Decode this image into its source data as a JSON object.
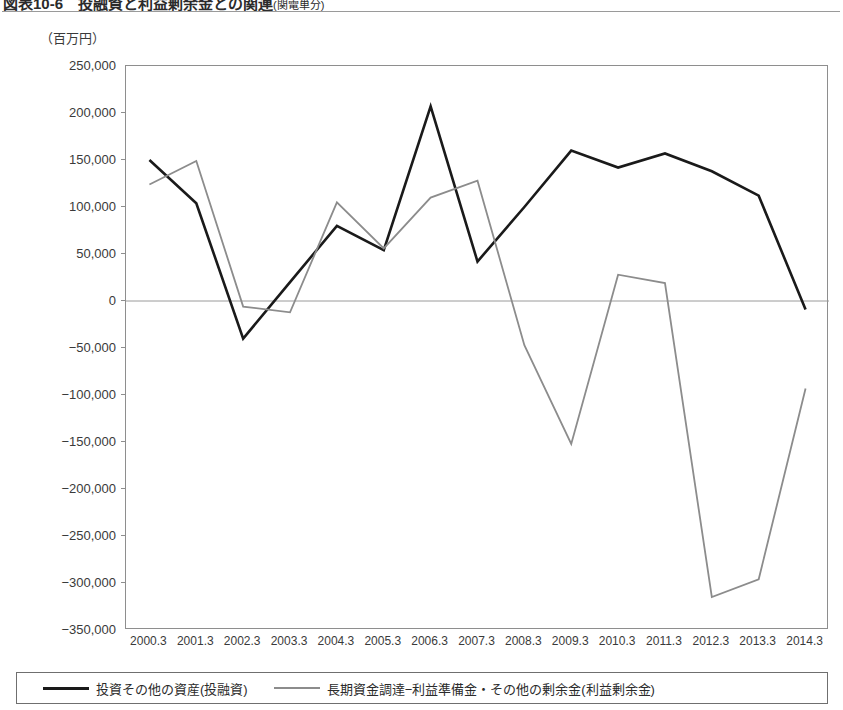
{
  "figure": {
    "title": "図表10-6　投融資と利益剰余金との関連",
    "title_suffix": "(関電単分)",
    "unit_caption": "（百万円）"
  },
  "legend": {
    "position": "bottom",
    "entries": [
      {
        "label": "投資その他の資産(投融資)",
        "color": "#1a1a1a",
        "style": "thick"
      },
      {
        "label": "長期資金調達−利益準備金・その他の剰余金(利益剰余金)",
        "color": "#8c8c8c",
        "style": "thin"
      }
    ]
  },
  "chart_data": {
    "type": "line",
    "title": "図表10-6　投融資と利益剰余金との関連(関電単分)",
    "xlabel": "",
    "ylabel": "（百万円）",
    "unit": "百万円",
    "grid": false,
    "zero_line": true,
    "legend_position": "bottom",
    "ylim": [
      -350000,
      250000
    ],
    "ytick_step": 50000,
    "ytick_labels": [
      "250,000",
      "200,000",
      "150,000",
      "100,000",
      "50,000",
      "0",
      "−50,000",
      "−100,000",
      "−150,000",
      "−200,000",
      "−250,000",
      "−300,000",
      "−350,000"
    ],
    "yticks": [
      250000,
      200000,
      150000,
      100000,
      50000,
      0,
      -50000,
      -100000,
      -150000,
      -200000,
      -250000,
      -300000,
      -350000
    ],
    "categories": [
      "2000.3",
      "2001.3",
      "2002.3",
      "2003.3",
      "2004.3",
      "2005.3",
      "2006.3",
      "2007.3",
      "2008.3",
      "2009.3",
      "2010.3",
      "2011.3",
      "2012.3",
      "2013.3",
      "2014.3"
    ],
    "series": [
      {
        "name": "投資その他の資産(投融資)",
        "color": "#1a1a1a",
        "width": 2.6,
        "values": [
          150000,
          104000,
          -40000,
          20000,
          80000,
          54000,
          207000,
          42000,
          100000,
          160000,
          142000,
          157000,
          138000,
          112000,
          -9000
        ]
      },
      {
        "name": "長期資金調達−利益準備金・その他の剰余金(利益剰余金)",
        "color": "#8c8c8c",
        "width": 1.8,
        "values": [
          124000,
          149000,
          -6000,
          -12000,
          105000,
          56000,
          110000,
          128000,
          -47000,
          -152000,
          28000,
          19000,
          -315000,
          -296000,
          -93000
        ]
      }
    ]
  }
}
